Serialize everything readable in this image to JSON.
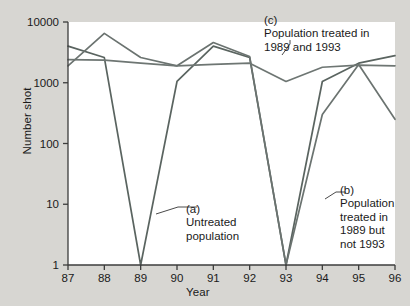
{
  "chart_data": {
    "type": "line",
    "title": "",
    "xlabel": "Year",
    "ylabel": "Number shot",
    "yscale": "log",
    "ylim": [
      1,
      10000
    ],
    "xlim": [
      87,
      96
    ],
    "grid": false,
    "legend_position": "inline-annotations",
    "x": [
      87,
      88,
      89,
      90,
      91,
      92,
      93,
      94,
      95,
      96
    ],
    "xticklabels": [
      "87",
      "88",
      "89",
      "90",
      "91",
      "92",
      "93",
      "94",
      "95",
      "96"
    ],
    "yticklabels": [
      "1",
      "10",
      "100",
      "1000",
      "10000"
    ],
    "ytickvalues": [
      1,
      10,
      100,
      1000,
      10000
    ],
    "series": [
      {
        "name": "Untreated population",
        "key": "a",
        "color": "#5a6460",
        "values": [
          4000,
          2600,
          1,
          1050,
          4000,
          2600,
          1,
          1050,
          2100,
          2800
        ]
      },
      {
        "name": "Population treated in 1989 but not 1993",
        "key": "b",
        "color": "#6b7370",
        "values": [
          1900,
          6500,
          2600,
          1900,
          4600,
          2700,
          1,
          300,
          2000,
          250
        ]
      },
      {
        "name": "Population treated in 1989 and 1993",
        "key": "c",
        "color": "#6e7673",
        "values": [
          2400,
          2350,
          2100,
          1900,
          2000,
          2100,
          1050,
          1800,
          1950,
          1900
        ]
      }
    ],
    "annotations": [
      {
        "key": "a",
        "text": "(a)\nUntreated\npopulation"
      },
      {
        "key": "b",
        "text": "(b)\nPopulation\ntreated in\n1989 but\nnot 1993"
      },
      {
        "key": "c",
        "text": "(c)\nPopulation treated in\n1989 and 1993"
      }
    ]
  }
}
